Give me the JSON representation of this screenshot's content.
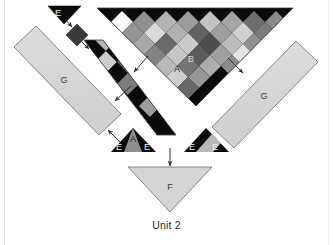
{
  "figure": {
    "caption": "Unit 2",
    "title": "Unit 2",
    "background_color": "#ffffff",
    "stroke_color": "#4a4a4a",
    "arrow_color": "#2f2f2f",
    "labels": {
      "big_triangle_a": "A",
      "big_triangle_b": "B",
      "left_panel_g": "G",
      "right_panel_g": "G",
      "bottom_triangle_f": "F",
      "left_small_e": "E",
      "left_base_e1": "E",
      "left_base_a": "A",
      "left_base_e2": "E",
      "right_base_e1": "E",
      "right_base_e2": "E"
    },
    "parts": [
      {
        "id": "big-checkered-triangle",
        "name": "Big checkered triangle",
        "labels": [
          "A",
          "B"
        ],
        "fill": "#0a0a0a",
        "pattern": "diamond-checkerboard"
      },
      {
        "id": "left-checkered-strip",
        "name": "Left diagonal checkered strip",
        "fill": "#0a0a0a",
        "pattern": "diamond-checkerboard"
      },
      {
        "id": "top-left-e-triangle",
        "name": "Top left E triangle",
        "labels": [
          "E"
        ],
        "fill": "#0a0a0a"
      },
      {
        "id": "top-left-dark-diamond",
        "name": "Top left dark diamond",
        "fill": "#3a3a3a"
      },
      {
        "id": "left-g-panel",
        "name": "Left G panel",
        "labels": [
          "G"
        ],
        "fill": "#d4d4d4"
      },
      {
        "id": "right-g-panel",
        "name": "Right G panel",
        "labels": [
          "G"
        ],
        "fill": "#d4d4d4"
      },
      {
        "id": "left-base-triangle",
        "name": "Left base E A E triangle",
        "labels": [
          "E",
          "A",
          "E"
        ],
        "fill": "#0a0a0a"
      },
      {
        "id": "right-base-triangle",
        "name": "Right base E E triangle",
        "labels": [
          "E",
          "E"
        ],
        "fill": "#0a0a0a"
      },
      {
        "id": "bottom-f-triangle",
        "name": "Bottom F triangle",
        "labels": [
          "F"
        ],
        "fill": "#d4d4d4"
      }
    ],
    "arrows": [
      {
        "id": "arrow-e-to-diamond",
        "from": "top-left-e-triangle",
        "to": "top-left-dark-diamond"
      },
      {
        "id": "arrow-diamond-to-strip",
        "from": "top-left-dark-diamond",
        "to": "left-checkered-strip"
      },
      {
        "id": "arrow-strip-to-left-g",
        "from": "left-checkered-strip",
        "to": "left-g-panel"
      },
      {
        "id": "arrow-big-to-strip",
        "from": "big-checkered-triangle",
        "to": "left-checkered-strip"
      },
      {
        "id": "arrow-big-to-right-g",
        "from": "big-checkered-triangle",
        "to": "right-g-panel"
      },
      {
        "id": "arrow-base-to-left-g",
        "from": "left-base-triangle",
        "to": "left-g-panel"
      },
      {
        "id": "arrow-down-to-f",
        "from": "left-checkered-strip",
        "to": "bottom-f-triangle"
      }
    ],
    "palette": {
      "black": "#0a0a0a",
      "white": "#fbfbfb",
      "light_gray": "#d4d4d4",
      "mid_gray": "#9a9a9a",
      "dark_gray": "#5a5a5a",
      "panel_gray": "#d4d4d4",
      "outline": "#4a4a4a",
      "text_dark": "#2b2b2b",
      "text_light": "#efefef",
      "page_line": "#e2e2e2"
    }
  }
}
